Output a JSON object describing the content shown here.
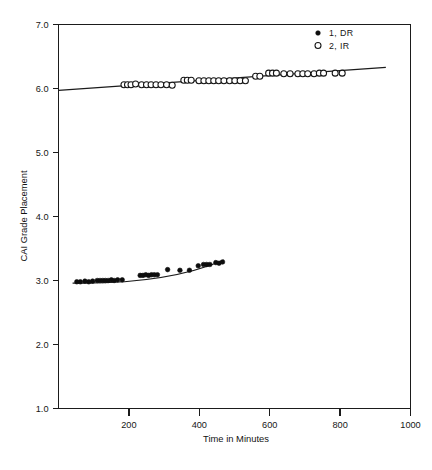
{
  "chart_data": {
    "type": "scatter",
    "title": "",
    "xlabel": "Time in Minutes",
    "ylabel": "CAI Grade Placement",
    "xlim": [
      0,
      1000
    ],
    "ylim": [
      1.0,
      7.0
    ],
    "xticks": [
      200,
      400,
      600,
      800,
      1000
    ],
    "xtick_labels": [
      "200",
      "400",
      "600",
      "800",
      "1000"
    ],
    "yticks": [
      1.0,
      2.0,
      3.0,
      4.0,
      5.0,
      6.0,
      7.0
    ],
    "ytick_labels": [
      "1.0",
      "2.0",
      "3.0",
      "4.0",
      "5.0",
      "6.0",
      "7.0"
    ],
    "grid": false,
    "legend_position": "top-right",
    "series": [
      {
        "name": "1, DR",
        "marker": "filled-circle",
        "color": "#0d0d0d",
        "points": [
          [
            52,
            2.98
          ],
          [
            62,
            2.98
          ],
          [
            75,
            2.99
          ],
          [
            86,
            2.98
          ],
          [
            97,
            2.99
          ],
          [
            110,
            3.0
          ],
          [
            118,
            3.0
          ],
          [
            126,
            3.0
          ],
          [
            133,
            3.0
          ],
          [
            141,
            3.0
          ],
          [
            150,
            3.01
          ],
          [
            158,
            3.0
          ],
          [
            168,
            3.01
          ],
          [
            181,
            3.01
          ],
          [
            232,
            3.08
          ],
          [
            240,
            3.08
          ],
          [
            248,
            3.09
          ],
          [
            256,
            3.08
          ],
          [
            264,
            3.09
          ],
          [
            272,
            3.09
          ],
          [
            281,
            3.09
          ],
          [
            310,
            3.17
          ],
          [
            345,
            3.16
          ],
          [
            372,
            3.16
          ],
          [
            397,
            3.23
          ],
          [
            412,
            3.25
          ],
          [
            421,
            3.25
          ],
          [
            430,
            3.25
          ],
          [
            447,
            3.28
          ],
          [
            456,
            3.27
          ],
          [
            466,
            3.29
          ]
        ],
        "fit_line": [
          [
            40,
            2.96
          ],
          [
            470,
            3.32
          ]
        ]
      },
      {
        "name": "2, IR",
        "marker": "open-circle",
        "color": "#141414",
        "points": [
          [
            186,
            6.06
          ],
          [
            196,
            6.06
          ],
          [
            206,
            6.06
          ],
          [
            219,
            6.07
          ],
          [
            236,
            6.06
          ],
          [
            250,
            6.06
          ],
          [
            263,
            6.06
          ],
          [
            277,
            6.06
          ],
          [
            291,
            6.06
          ],
          [
            307,
            6.06
          ],
          [
            323,
            6.05
          ],
          [
            356,
            6.13
          ],
          [
            366,
            6.13
          ],
          [
            377,
            6.13
          ],
          [
            399,
            6.12
          ],
          [
            413,
            6.12
          ],
          [
            427,
            6.12
          ],
          [
            441,
            6.12
          ],
          [
            455,
            6.12
          ],
          [
            470,
            6.12
          ],
          [
            486,
            6.12
          ],
          [
            501,
            6.12
          ],
          [
            516,
            6.12
          ],
          [
            531,
            6.12
          ],
          [
            560,
            6.19
          ],
          [
            572,
            6.19
          ],
          [
            597,
            6.24
          ],
          [
            608,
            6.24
          ],
          [
            619,
            6.24
          ],
          [
            640,
            6.23
          ],
          [
            658,
            6.23
          ],
          [
            680,
            6.23
          ],
          [
            694,
            6.23
          ],
          [
            708,
            6.23
          ],
          [
            726,
            6.23
          ],
          [
            741,
            6.24
          ],
          [
            753,
            6.24
          ],
          [
            786,
            6.24
          ],
          [
            806,
            6.24
          ]
        ],
        "fit_line": [
          [
            0,
            5.97
          ],
          [
            930,
            6.33
          ]
        ]
      }
    ]
  },
  "legend": {
    "entries": [
      {
        "label": "1, DR",
        "marker": "filled-circle"
      },
      {
        "label": "2, IR",
        "marker": "open-circle"
      }
    ]
  },
  "axes": {
    "x_title": "Time in Minutes",
    "y_title": "CAI Grade Placement"
  }
}
